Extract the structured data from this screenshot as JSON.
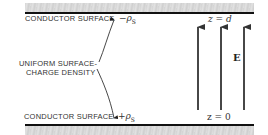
{
  "diagram": {
    "top_plate_label": "CONDUCTOR SURFACE",
    "bottom_plate_label": "CONDUCTOR SURFACE",
    "top_charge": "−ρS",
    "bottom_charge": "+ρS",
    "density_label_line1": "UNIFORM SURFACE-",
    "density_label_line2": "CHARGE DENSITY",
    "top_boundary": "z = d",
    "bottom_boundary": "z = 0",
    "field_label": "E",
    "field_arrow_count": 3,
    "colors": {
      "plate_fill": "#d8d8d8",
      "line": "#111111",
      "text": "#333333"
    }
  }
}
